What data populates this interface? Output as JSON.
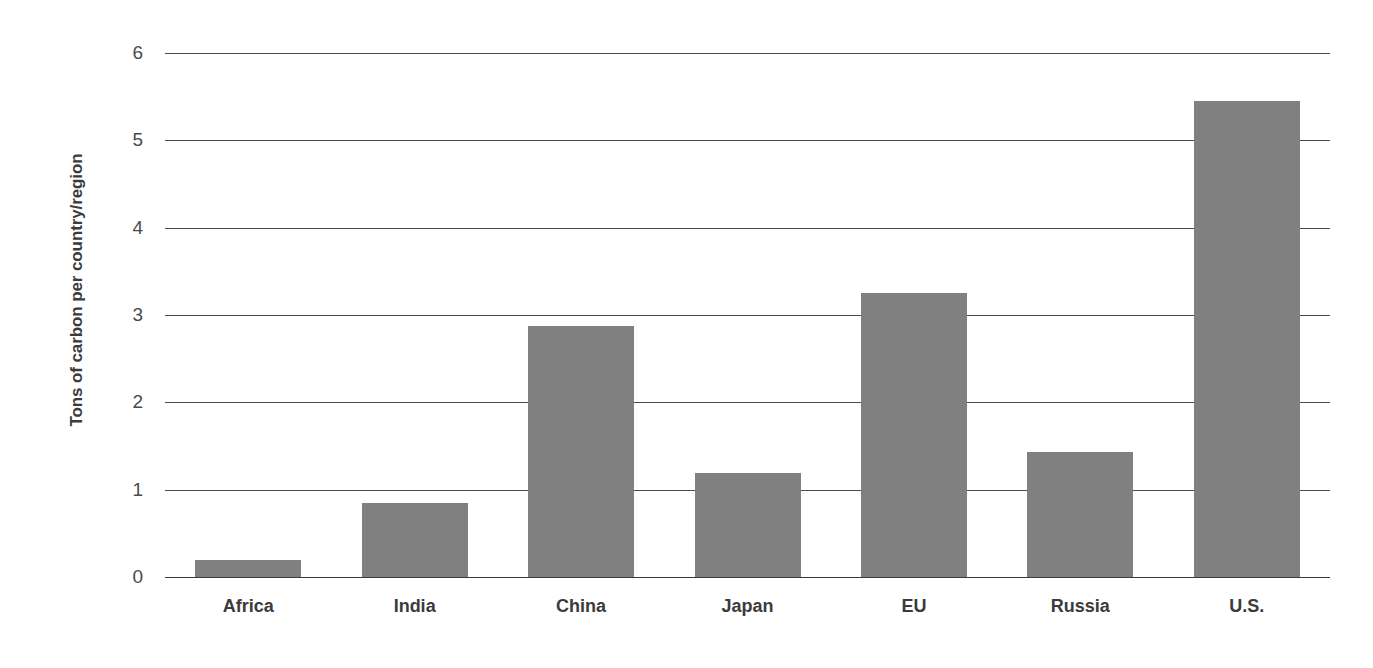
{
  "chart_data": {
    "type": "bar",
    "title": "",
    "subtitle": "",
    "xlabel": "",
    "ylabel": "Tons of carbon per country/region",
    "categories": [
      "Africa",
      "India",
      "China",
      "Japan",
      "EU",
      "Russia",
      "U.S."
    ],
    "values": [
      0.2,
      0.85,
      2.87,
      1.19,
      3.25,
      1.43,
      5.45
    ],
    "series": [
      {
        "name": "Tons of carbon per country/region",
        "values": [
          0.2,
          0.85,
          2.87,
          1.19,
          3.25,
          1.43,
          5.45
        ]
      }
    ],
    "ylim": [
      0,
      6
    ],
    "ytick_labels": [
      "0",
      "1",
      "2",
      "3",
      "4",
      "5",
      "6"
    ],
    "ytick_values": [
      0,
      1,
      2,
      3,
      4,
      5,
      6
    ],
    "grid": "horizontal",
    "legend": "none",
    "bar_color": "#808080",
    "gridline_color": "#4a4a4a",
    "text_color": "#3b3b3b",
    "background_color": "#ffffff",
    "annotations": []
  }
}
